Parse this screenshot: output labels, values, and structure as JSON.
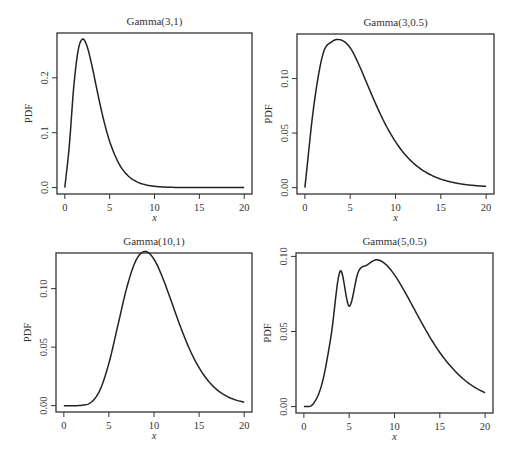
{
  "figure": {
    "background": "#ffffff",
    "line_color": "#222222",
    "frame_color": "#333333"
  },
  "chart_data": [
    {
      "type": "line",
      "panel": "top-left",
      "title": "Gamma(3,1)",
      "xlabel": "x",
      "ylabel": "PDF",
      "distribution": {
        "shape": 3,
        "rate": 1
      },
      "xlim": [
        0,
        20
      ],
      "ylim": [
        0,
        0.27
      ],
      "xticks": [
        0,
        5,
        10,
        15,
        20
      ],
      "xtick_labels": [
        "0",
        "5",
        "10",
        "15",
        "20"
      ],
      "yticks": [
        0.0,
        0.1,
        0.2
      ],
      "ytick_labels": [
        "0.0",
        "0.1",
        "0.2"
      ],
      "grid": false,
      "box": {
        "left": 57,
        "top": 33,
        "right": 252,
        "bottom": 194
      },
      "x": [
        0,
        0.5,
        1,
        1.5,
        2,
        2.5,
        3,
        3.5,
        4,
        4.5,
        5,
        6,
        7,
        8,
        9,
        10,
        11,
        12,
        13,
        14,
        15,
        16,
        17,
        18,
        19,
        20
      ],
      "y": [
        0,
        0.0758,
        0.1839,
        0.251,
        0.2707,
        0.2565,
        0.224,
        0.185,
        0.1465,
        0.1125,
        0.0842,
        0.0446,
        0.0223,
        0.0107,
        0.005,
        0.0023,
        0.001,
        0.0004,
        0.0002,
        0.0001,
        0,
        0,
        0,
        0,
        0,
        0
      ]
    },
    {
      "type": "line",
      "panel": "top-right",
      "title": "Gamma(3,0.5)",
      "xlabel": "x",
      "ylabel": "PDF",
      "distribution": {
        "shape": 3,
        "rate": 0.5
      },
      "xlim": [
        0,
        20
      ],
      "ylim": [
        0,
        0.135
      ],
      "xticks": [
        0,
        5,
        10,
        15,
        20
      ],
      "xtick_labels": [
        "0",
        "5",
        "10",
        "15",
        "20"
      ],
      "yticks": [
        0.0,
        0.05,
        0.1
      ],
      "ytick_labels": [
        "0.00",
        "0.05",
        "0.10"
      ],
      "grid": false,
      "box": {
        "left": 297,
        "top": 34,
        "right": 494,
        "bottom": 194
      },
      "x": [
        0,
        1,
        2,
        3,
        4,
        5,
        6,
        7,
        8,
        9,
        10,
        11,
        12,
        13,
        14,
        15,
        16,
        17,
        18,
        19,
        20
      ],
      "y": [
        0,
        0.0758,
        0.1226,
        0.1339,
        0.1353,
        0.1283,
        0.112,
        0.0925,
        0.0733,
        0.0562,
        0.0421,
        0.0308,
        0.0223,
        0.0159,
        0.0112,
        0.0078,
        0.0054,
        0.0037,
        0.0025,
        0.0017,
        0.0011
      ]
    },
    {
      "type": "line",
      "panel": "bottom-left",
      "title": "Gamma(10,1)",
      "xlabel": "x",
      "ylabel": "PDF",
      "distribution": {
        "shape": 10,
        "rate": 1
      },
      "xlim": [
        0,
        20
      ],
      "ylim": [
        0,
        0.125
      ],
      "xticks": [
        0,
        5,
        10,
        15,
        20
      ],
      "xtick_labels": [
        "0",
        "5",
        "10",
        "15",
        "20"
      ],
      "yticks": [
        0.0,
        0.05,
        0.1
      ],
      "ytick_labels": [
        "0.00",
        "0.05",
        "0.10"
      ],
      "grid": false,
      "box": {
        "left": 56,
        "top": 253,
        "right": 252,
        "bottom": 412
      },
      "x": [
        0,
        1,
        2,
        3,
        4,
        5,
        6,
        7,
        8,
        9,
        10,
        11,
        12,
        13,
        14,
        15,
        16,
        17,
        18,
        19,
        20
      ],
      "y": [
        0,
        0,
        0.0003,
        0.0027,
        0.0132,
        0.0363,
        0.0688,
        0.1014,
        0.1241,
        0.1318,
        0.1251,
        0.1085,
        0.0874,
        0.0661,
        0.0473,
        0.0324,
        0.0213,
        0.0135,
        0.0083,
        0.005,
        0.0029
      ]
    },
    {
      "type": "line",
      "panel": "bottom-right",
      "title": "Gamma(5,0.5)",
      "xlabel": "x",
      "ylabel": "PDF",
      "distribution": {
        "shape": 5,
        "rate": 0.5
      },
      "xlim": [
        0,
        20
      ],
      "ylim": [
        0,
        0.098
      ],
      "xticks": [
        0,
        5,
        10,
        15,
        20
      ],
      "xtick_labels": [
        "0",
        "5",
        "10",
        "15",
        "20"
      ],
      "yticks": [
        0.0,
        0.05,
        0.1
      ],
      "ytick_labels": [
        "0.00",
        "0.05",
        "0.10"
      ],
      "grid": false,
      "box": {
        "left": 296,
        "top": 253,
        "right": 493,
        "bottom": 413
      },
      "x": [
        0,
        1,
        2,
        3,
        4,
        5,
        6,
        7,
        8,
        9,
        10,
        11,
        12,
        13,
        14,
        15,
        16,
        17,
        18,
        19,
        20
      ],
      "y": [
        0,
        0.0016,
        0.0153,
        0.0471,
        0.0902,
        0.0668,
        0.0896,
        0.0944,
        0.0977,
        0.0949,
        0.0877,
        0.0779,
        0.0669,
        0.0558,
        0.0453,
        0.036,
        0.0282,
        0.0217,
        0.0164,
        0.0123,
        0.0092
      ]
    }
  ]
}
